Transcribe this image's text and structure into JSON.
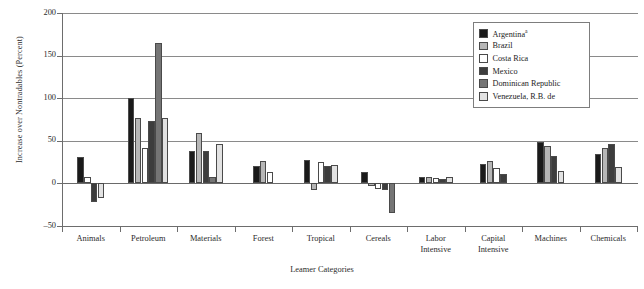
{
  "chart_data": {
    "type": "bar",
    "title": "",
    "xlabel": "Leamer Categories",
    "ylabel": "Increase over Nontradables (Percent)",
    "ylim": [
      -50,
      200
    ],
    "yticks": [
      -50,
      0,
      50,
      100,
      150,
      200
    ],
    "ytick_labels": [
      "–50",
      "0",
      "50",
      "100",
      "150",
      "200"
    ],
    "grid": true,
    "legend_position": "top-right",
    "categories": [
      "Animals",
      "Petroleum",
      "Materials",
      "Forest",
      "Tropical",
      "Cereals",
      "Labor Intensive",
      "Capital Intensive",
      "Machines",
      "Chemicals"
    ],
    "category_lines": [
      [
        "Animals"
      ],
      [
        "Petroleum"
      ],
      [
        "Materials"
      ],
      [
        "Forest"
      ],
      [
        "Tropical"
      ],
      [
        "Cereals"
      ],
      [
        "Labor",
        "Intensive"
      ],
      [
        "Capital",
        "Intensive"
      ],
      [
        "Machines"
      ],
      [
        "Chemicals"
      ]
    ],
    "series": [
      {
        "name": "Argentina",
        "superscript": "a",
        "color": "#1a1a1a",
        "values": [
          31,
          100,
          38,
          21,
          27,
          13,
          8,
          23,
          49,
          35
        ]
      },
      {
        "name": "Brazil",
        "superscript": "",
        "color": "#b6b6b6",
        "values": [
          null,
          77,
          59,
          26,
          -8,
          -3,
          7,
          26,
          44,
          42
        ]
      },
      {
        "name": "Costa Rica",
        "superscript": "",
        "color": "#ffffff",
        "values": [
          8,
          42,
          null,
          13,
          25,
          -6,
          6,
          18,
          null,
          null
        ]
      },
      {
        "name": "Mexico",
        "superscript": "",
        "color": "#3d3d3d",
        "values": [
          -22,
          73,
          38,
          null,
          21,
          -8,
          5,
          11,
          32,
          46
        ]
      },
      {
        "name": "Dominican Republic",
        "superscript": "",
        "color": "#757575",
        "values": [
          null,
          165,
          7,
          null,
          null,
          -35,
          null,
          null,
          null,
          null
        ]
      },
      {
        "name": "Venezuela, R.B. de",
        "superscript": "",
        "color": "#e2e2e2",
        "values": [
          -17,
          77,
          46,
          null,
          22,
          null,
          8,
          null,
          14,
          19
        ]
      }
    ]
  },
  "legend": {
    "items": [
      "Argentina",
      "Brazil",
      "Costa Rica",
      "Mexico",
      "Dominican Republic",
      "Venezuela, R.B. de"
    ],
    "argentina_superscript": "a"
  }
}
